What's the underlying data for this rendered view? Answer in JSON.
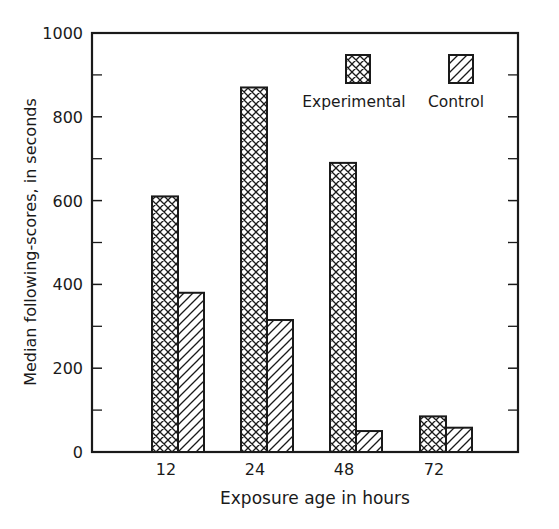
{
  "chart_data": {
    "type": "bar",
    "title": "",
    "xlabel": "Exposure age in hours",
    "ylabel": "Median following-scores, in seconds",
    "categories": [
      "12",
      "24",
      "48",
      "72"
    ],
    "series": [
      {
        "name": "Experimental",
        "pattern": "crosshatch",
        "values": [
          610,
          870,
          690,
          85
        ]
      },
      {
        "name": "Control",
        "pattern": "diagonal-hatch",
        "values": [
          380,
          315,
          50,
          58
        ]
      }
    ],
    "ylim": [
      0,
      1000
    ],
    "yticks": [
      "0",
      "200",
      "400",
      "600",
      "800",
      "1000"
    ],
    "minor_yticks": [
      100,
      300,
      500,
      700,
      900
    ],
    "grid": false,
    "legend_position": "upper right, inside plot"
  },
  "legend": {
    "experimental": "Experimental",
    "control": "Control"
  },
  "colors": {
    "ink": "#1a1a1a",
    "background": "#ffffff"
  }
}
